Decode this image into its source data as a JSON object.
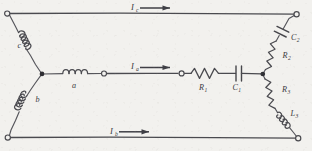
{
  "figure": {
    "kind": "circuit-schematic",
    "style": "hand-drawn pencil sketch",
    "background_color": "#f2f1ee",
    "ink_color": "#4a4a4f"
  },
  "currents": [
    {
      "id": "Ic",
      "base": "I",
      "sub": "c",
      "line": "top",
      "direction": "right"
    },
    {
      "id": "Ia",
      "base": "I",
      "sub": "a",
      "line": "middle",
      "direction": "right"
    },
    {
      "id": "Ib",
      "base": "I",
      "sub": "b",
      "line": "bottom",
      "direction": "right"
    }
  ],
  "source_network": {
    "topology": "wye",
    "branches": [
      {
        "id": "c",
        "base": "c",
        "sub": "",
        "type": "inductor",
        "position": "upper-left-diagonal"
      },
      {
        "id": "a",
        "base": "a",
        "sub": "",
        "type": "inductor",
        "position": "middle-horizontal"
      },
      {
        "id": "b",
        "base": "b",
        "sub": "",
        "type": "inductor",
        "position": "lower-left-diagonal"
      }
    ]
  },
  "load_network": {
    "topology": "delta",
    "branches": [
      {
        "id": "R1",
        "base": "R",
        "sub": "1",
        "type": "resistor",
        "position": "middle-horizontal"
      },
      {
        "id": "C1",
        "base": "C",
        "sub": "1",
        "type": "capacitor",
        "position": "middle-horizontal"
      },
      {
        "id": "C2",
        "base": "C",
        "sub": "2",
        "type": "capacitor",
        "position": "upper-right-diagonal"
      },
      {
        "id": "R2",
        "base": "R",
        "sub": "2",
        "type": "resistor",
        "position": "upper-right-diagonal"
      },
      {
        "id": "R3",
        "base": "R",
        "sub": "3",
        "type": "resistor",
        "position": "lower-right-diagonal"
      },
      {
        "id": "L3",
        "base": "L",
        "sub": "3",
        "type": "inductor",
        "position": "lower-right-diagonal"
      }
    ]
  },
  "terminals": [
    {
      "id": "top-left",
      "style": "open-circle"
    },
    {
      "id": "top-right",
      "style": "open-circle"
    },
    {
      "id": "bottom-left",
      "style": "open-circle"
    },
    {
      "id": "bottom-right",
      "style": "open-circle"
    },
    {
      "id": "mid-left",
      "style": "open-circle"
    },
    {
      "id": "mid-right",
      "style": "open-circle"
    }
  ],
  "junctions": [
    {
      "id": "wye-center",
      "style": "filled-dot"
    },
    {
      "id": "delta-right",
      "style": "filled-dot"
    }
  ]
}
